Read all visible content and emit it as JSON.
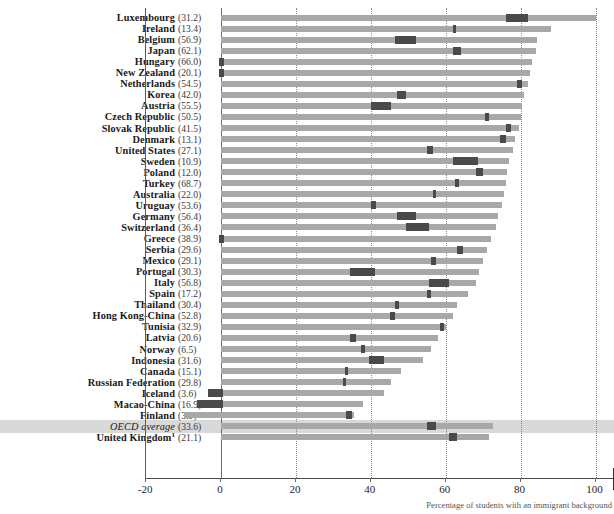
{
  "chart_data": {
    "type": "bar",
    "title": "",
    "xlabel": "Percentage of students with an immigrant background",
    "ylabel": "",
    "xlim": [
      -20,
      100
    ],
    "xticks": [
      -20,
      0,
      20,
      40,
      60,
      80,
      100
    ],
    "grid": true,
    "legend_position": "none",
    "value_label_note": "Value in parentheses after each country name",
    "categories": [
      "Luxembourg",
      "Ireland",
      "Belgium",
      "Japan",
      "Hungary",
      "New Zealand",
      "Netherlands",
      "Korea",
      "Austria",
      "Czech Republic",
      "Slovak Republic",
      "Denmark",
      "United States",
      "Sweden",
      "Poland",
      "Turkey",
      "Australia",
      "Uruguay",
      "Germany",
      "Switzerland",
      "Greece",
      "Serbia",
      "Mexico",
      "Portugal",
      "Italy",
      "Spain",
      "Thailand",
      "Hong Kong-China",
      "Tunisia",
      "Latvia",
      "Norway",
      "Indonesia",
      "Canada",
      "Russian Federation",
      "Iceland",
      "Macao-China",
      "Finland",
      "OECD average",
      "United Kingdom"
    ],
    "parenthetical_values": [
      "(31.2)",
      "(13.4)",
      "(56.9)",
      "(62.1)",
      "(66.0)",
      "(20.1)",
      "(54.5)",
      "(42.0)",
      "(55.5)",
      "(50.5)",
      "(41.5)",
      "(13.1)",
      "(27.1)",
      "(10.9)",
      "(12.0)",
      "(68.7)",
      "(22.0)",
      "(53.6)",
      "(56.4)",
      "(36.4)",
      "(38.9)",
      "(29.6)",
      "(29.1)",
      "(30.3)",
      "(56.8)",
      "(17.2)",
      "(30.4)",
      "(52.8)",
      "(32.9)",
      "(20.6)",
      "(6.5)",
      "(31.6)",
      "(15.1)",
      "(29.8)",
      "(3.6)",
      "(16.9)",
      "(3.9)",
      "(33.6)",
      "(21.1)"
    ],
    "values": [
      100.0,
      88.0,
      84.5,
      84.0,
      83.0,
      82.5,
      82.0,
      81.0,
      80.5,
      80.0,
      79.5,
      78.5,
      78.0,
      77.0,
      76.5,
      76.0,
      75.5,
      75.0,
      74.0,
      73.5,
      72.0,
      71.0,
      70.0,
      69.0,
      68.0,
      66.0,
      63.0,
      62.0,
      60.0,
      58.0,
      56.0,
      54.0,
      48.0,
      45.5,
      43.5,
      38.0,
      35.5,
      72.5,
      71.5
    ],
    "markers": [
      {
        "start": 76.0,
        "end": 82.0
      },
      {
        "start": 62.0,
        "end": 62.8
      },
      {
        "start": 46.5,
        "end": 52.0
      },
      {
        "start": 62.0,
        "end": 64.0
      },
      {
        "start": -0.6,
        "end": 0.8
      },
      {
        "start": -0.6,
        "end": 0.8
      },
      {
        "start": 79.0,
        "end": 80.5
      },
      {
        "start": 47.0,
        "end": 49.5
      },
      {
        "start": 40.0,
        "end": 45.5
      },
      {
        "start": 70.5,
        "end": 71.5
      },
      {
        "start": 76.0,
        "end": 77.5
      },
      {
        "start": 74.5,
        "end": 76.0
      },
      {
        "start": 55.0,
        "end": 56.5
      },
      {
        "start": 62.0,
        "end": 68.5
      },
      {
        "start": 68.0,
        "end": 70.0
      },
      {
        "start": 62.5,
        "end": 63.5
      },
      {
        "start": 56.5,
        "end": 57.5
      },
      {
        "start": 40.0,
        "end": 41.5
      },
      {
        "start": 47.0,
        "end": 52.0
      },
      {
        "start": 49.5,
        "end": 55.5
      },
      {
        "start": -0.6,
        "end": 0.8
      },
      {
        "start": 63.0,
        "end": 64.5
      },
      {
        "start": 56.0,
        "end": 57.5
      },
      {
        "start": 34.5,
        "end": 41.0
      },
      {
        "start": 55.5,
        "end": 61.0
      },
      {
        "start": 55.0,
        "end": 56.0
      },
      {
        "start": 46.5,
        "end": 47.5
      },
      {
        "start": 45.0,
        "end": 46.5
      },
      {
        "start": 58.5,
        "end": 59.5
      },
      {
        "start": 34.5,
        "end": 36.0
      },
      {
        "start": 37.5,
        "end": 38.5
      },
      {
        "start": 39.5,
        "end": 43.5
      },
      {
        "start": 33.0,
        "end": 34.0
      },
      {
        "start": 32.5,
        "end": 33.5
      },
      {
        "start": -3.5,
        "end": 0.5
      },
      {
        "start": -6.5,
        "end": 0.5
      },
      {
        "start": 33.5,
        "end": 35.0
      },
      {
        "start": 55.0,
        "end": 57.5
      },
      {
        "start": 61.0,
        "end": 63.0
      }
    ],
    "negative_bars": [
      {
        "category": "Finland",
        "start": -10.0,
        "end": 35.5
      }
    ],
    "colors": {
      "bar": "#a8a8a8",
      "marker": "#4a4a4a",
      "highlight_band": "#d6d6d6",
      "axis": "#4a4a4a",
      "grid": "#8a8a8a"
    }
  },
  "axis": {
    "ticks": [
      "-20",
      "0",
      "20",
      "40",
      "60",
      "80",
      "100"
    ]
  },
  "footnote": {
    "text": "Percentage of students with an immigrant background"
  }
}
